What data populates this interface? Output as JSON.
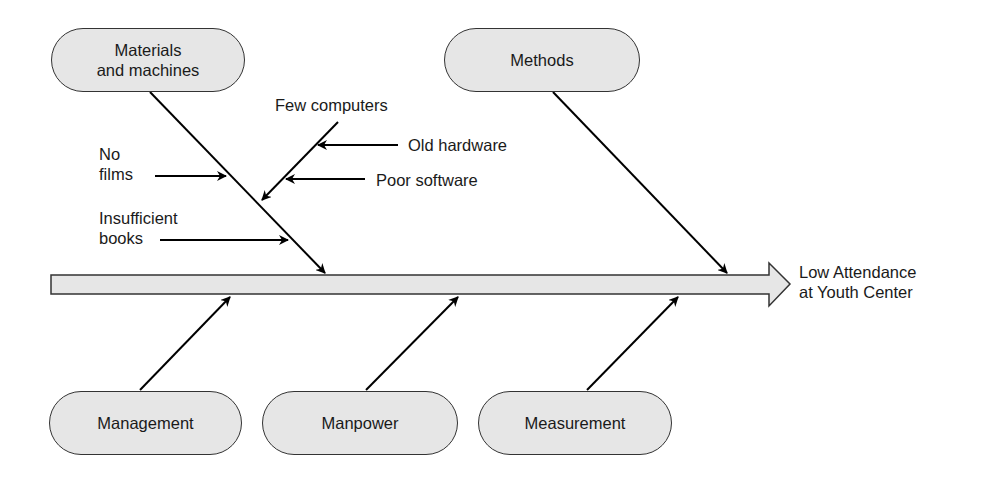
{
  "diagram": {
    "type": "fishbone",
    "effect": {
      "line1": "Low Attendance",
      "line2": "at Youth Center"
    },
    "categories": {
      "materials": {
        "line1": "Materials",
        "line2": "and machines"
      },
      "methods": "Methods",
      "management": "Management",
      "manpower": "Manpower",
      "measurement": "Measurement"
    },
    "causes": {
      "no_films": {
        "line1": "No",
        "line2": "films"
      },
      "insufficient_books": {
        "line1": "Insufficient",
        "line2": "books"
      },
      "few_computers": "Few computers",
      "old_hardware": "Old hardware",
      "poor_software": "Poor software"
    },
    "colors": {
      "box_fill": "#e6e6e6",
      "spine_fill": "#e6e6e6",
      "line": "#000000"
    }
  }
}
